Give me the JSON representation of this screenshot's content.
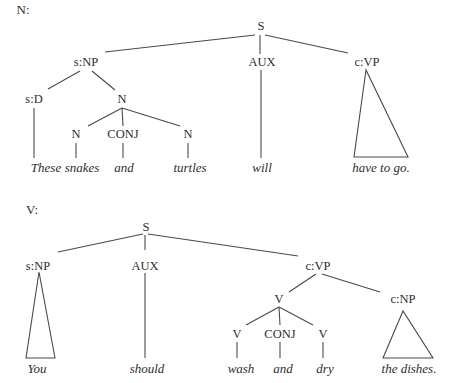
{
  "colors": {
    "background": "#ffffff",
    "text": "#2e2e2e",
    "lines": "#4a4a4a"
  },
  "trees": [
    {
      "title": "N:",
      "title_pos": [
        23,
        14
      ],
      "nodes": [
        {
          "id": "S",
          "label": "S",
          "x": 261,
          "y": 30,
          "kind": "label"
        },
        {
          "id": "sNP",
          "label": "s:NP",
          "x": 86,
          "y": 66,
          "kind": "label"
        },
        {
          "id": "AUX",
          "label": "AUX",
          "x": 262,
          "y": 66,
          "kind": "label"
        },
        {
          "id": "cVP",
          "label": "c:VP",
          "x": 367,
          "y": 66,
          "kind": "label"
        },
        {
          "id": "sD",
          "label": "s:D",
          "x": 34,
          "y": 103,
          "kind": "label"
        },
        {
          "id": "N1",
          "label": "N",
          "x": 122,
          "y": 103,
          "kind": "label"
        },
        {
          "id": "N2",
          "label": "N",
          "x": 76,
          "y": 138,
          "kind": "label"
        },
        {
          "id": "CONJ1",
          "label": "CONJ",
          "x": 123,
          "y": 138,
          "kind": "label"
        },
        {
          "id": "N3",
          "label": "N",
          "x": 188,
          "y": 138,
          "kind": "label"
        },
        {
          "id": "w1",
          "label": "These",
          "x": 46,
          "y": 172,
          "kind": "word"
        },
        {
          "id": "w2",
          "label": "snakes",
          "x": 82,
          "y": 172,
          "kind": "word"
        },
        {
          "id": "w3",
          "label": "and",
          "x": 124,
          "y": 172,
          "kind": "word"
        },
        {
          "id": "w4",
          "label": "turtles",
          "x": 190,
          "y": 172,
          "kind": "word"
        },
        {
          "id": "w5",
          "label": "will",
          "x": 262,
          "y": 172,
          "kind": "word"
        },
        {
          "id": "w6",
          "label": "have to go.",
          "x": 381,
          "y": 172,
          "kind": "word"
        }
      ],
      "edges": [
        [
          255,
          35,
          105,
          52
        ],
        [
          260,
          35,
          260,
          54
        ],
        [
          265,
          35,
          348,
          53
        ],
        [
          80,
          71,
          48,
          89
        ],
        [
          92,
          71,
          115,
          90
        ],
        [
          34,
          108,
          34,
          158
        ],
        [
          122,
          108,
          88,
          126
        ],
        [
          122,
          108,
          123,
          126
        ],
        [
          122,
          108,
          180,
          126
        ],
        [
          76,
          143,
          76,
          158
        ],
        [
          123,
          143,
          123,
          158
        ],
        [
          188,
          143,
          188,
          158
        ],
        [
          261,
          70,
          261,
          158
        ]
      ],
      "triangles": [
        [
          [
            366,
            70
          ],
          [
            354,
            157
          ],
          [
            408,
            157
          ]
        ]
      ]
    },
    {
      "title": "V:",
      "title_pos": [
        32,
        214
      ],
      "nodes": [
        {
          "id": "S",
          "label": "S",
          "x": 146,
          "y": 231,
          "kind": "label"
        },
        {
          "id": "sNP",
          "label": "s:NP",
          "x": 38,
          "y": 270,
          "kind": "label"
        },
        {
          "id": "AUX",
          "label": "AUX",
          "x": 145,
          "y": 270,
          "kind": "label"
        },
        {
          "id": "cVP",
          "label": "c:VP",
          "x": 318,
          "y": 270,
          "kind": "label"
        },
        {
          "id": "V1",
          "label": "V",
          "x": 279,
          "y": 303,
          "kind": "label"
        },
        {
          "id": "cNP",
          "label": "c:NP",
          "x": 403,
          "y": 303,
          "kind": "label"
        },
        {
          "id": "V2",
          "label": "V",
          "x": 237,
          "y": 338,
          "kind": "label"
        },
        {
          "id": "CONJ2",
          "label": "CONJ",
          "x": 280,
          "y": 338,
          "kind": "label"
        },
        {
          "id": "V3",
          "label": "V",
          "x": 323,
          "y": 338,
          "kind": "label"
        },
        {
          "id": "w1",
          "label": "You",
          "x": 37,
          "y": 373,
          "kind": "word"
        },
        {
          "id": "w2",
          "label": "should",
          "x": 147,
          "y": 373,
          "kind": "word"
        },
        {
          "id": "w3",
          "label": "wash",
          "x": 241,
          "y": 373,
          "kind": "word"
        },
        {
          "id": "w4",
          "label": "and",
          "x": 283,
          "y": 373,
          "kind": "word"
        },
        {
          "id": "w5",
          "label": "dry",
          "x": 325,
          "y": 373,
          "kind": "word"
        },
        {
          "id": "w6",
          "label": "the dishes.",
          "x": 409,
          "y": 373,
          "kind": "word"
        }
      ],
      "edges": [
        [
          143,
          234,
          58,
          252
        ],
        [
          145,
          235,
          145,
          250
        ],
        [
          148,
          234,
          298,
          256
        ],
        [
          145,
          273,
          145,
          358
        ],
        [
          316,
          274,
          289,
          292
        ],
        [
          322,
          274,
          380,
          292
        ],
        [
          279,
          307,
          246,
          325
        ],
        [
          279,
          307,
          280,
          325
        ],
        [
          279,
          307,
          313,
          325
        ],
        [
          237,
          342,
          237,
          358
        ],
        [
          280,
          342,
          280,
          358
        ],
        [
          323,
          342,
          323,
          358
        ]
      ],
      "triangles": [
        [
          [
            39,
            272
          ],
          [
            26,
            358
          ],
          [
            55,
            358
          ]
        ],
        [
          [
            403,
            311
          ],
          [
            383,
            358
          ],
          [
            433,
            358
          ]
        ]
      ]
    }
  ]
}
